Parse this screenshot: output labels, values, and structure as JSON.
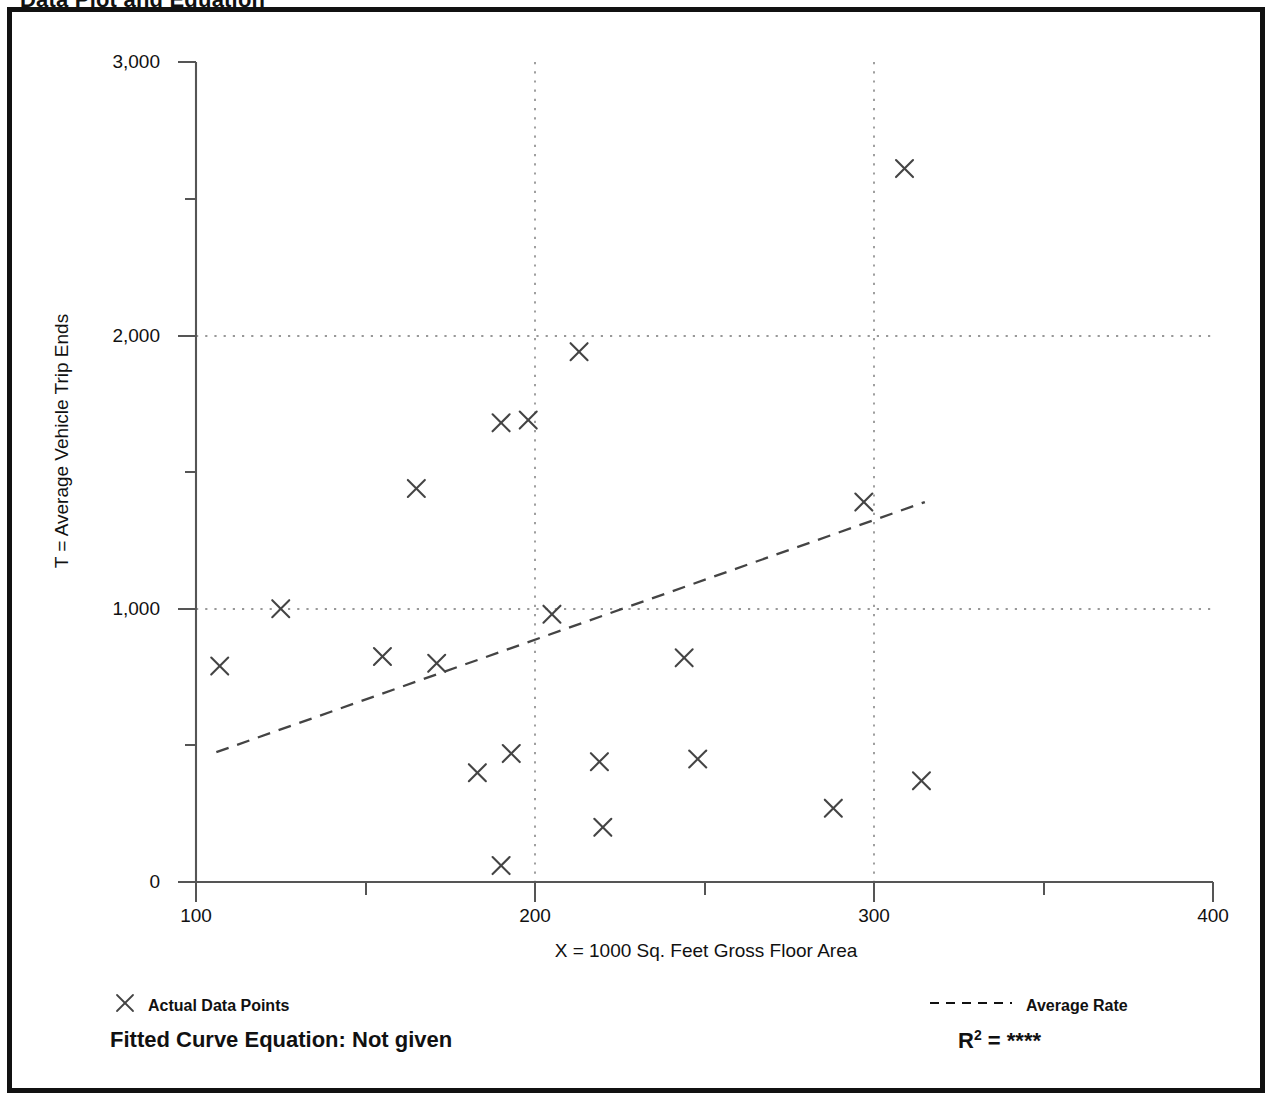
{
  "page": {
    "title": "Data Plot and Equation"
  },
  "chart_data": {
    "type": "scatter",
    "title": "Data Plot and Equation",
    "xlabel": "X = 1000 Sq. Feet Gross Floor Area",
    "ylabel": "T = Average Vehicle Trip Ends",
    "xlim": [
      100,
      400
    ],
    "ylim": [
      0,
      3000
    ],
    "xticks": [
      100,
      200,
      300,
      400
    ],
    "xticklabels": [
      "100",
      "200",
      "300",
      "400"
    ],
    "xminorticks": [
      150,
      250,
      350
    ],
    "yticks": [
      0,
      1000,
      2000,
      3000
    ],
    "yticklabels": [
      "0",
      "1,000",
      "2,000",
      "3,000"
    ],
    "yminorticks": [
      500,
      1500,
      2500
    ],
    "grid": "dotted gridlines at x=200, x=300 and y=1000, y=2000",
    "legend_position": "below plot",
    "series": [
      {
        "name": "Actual Data Points",
        "marker": "x",
        "points": [
          {
            "x": 107,
            "y": 790
          },
          {
            "x": 125,
            "y": 1000
          },
          {
            "x": 155,
            "y": 825
          },
          {
            "x": 165,
            "y": 1440
          },
          {
            "x": 171,
            "y": 800
          },
          {
            "x": 183,
            "y": 400
          },
          {
            "x": 190,
            "y": 1680
          },
          {
            "x": 190,
            "y": 60
          },
          {
            "x": 193,
            "y": 470
          },
          {
            "x": 198,
            "y": 1690
          },
          {
            "x": 205,
            "y": 980
          },
          {
            "x": 213,
            "y": 1940
          },
          {
            "x": 219,
            "y": 440
          },
          {
            "x": 220,
            "y": 200
          },
          {
            "x": 244,
            "y": 820
          },
          {
            "x": 248,
            "y": 450
          },
          {
            "x": 288,
            "y": 270
          },
          {
            "x": 297,
            "y": 1390
          },
          {
            "x": 309,
            "y": 2610
          },
          {
            "x": 314,
            "y": 370
          }
        ]
      },
      {
        "name": "Average Rate",
        "marker": "dashed-line",
        "line": [
          {
            "x": 106,
            "y": 475
          },
          {
            "x": 315,
            "y": 1390
          }
        ]
      }
    ],
    "annotations": {
      "equation": "Fitted Curve Equation:  Not given",
      "r_squared": "****"
    }
  },
  "axis": {
    "y_title": "T = Average Vehicle Trip Ends",
    "x_title": "X = 1000 Sq. Feet Gross Floor Area",
    "y_tick_labels": [
      "3,000",
      "2,000",
      "1,000",
      "0"
    ],
    "x_tick_labels": [
      "100",
      "200",
      "300",
      "400"
    ]
  },
  "legend": {
    "points_label": "Actual Data Points",
    "rate_label": "Average Rate",
    "point_marker": "x-marker",
    "rate_marker": "dashed-line"
  },
  "footer": {
    "equation_label": "Fitted Curve Equation:  Not given",
    "r2_prefix": "R",
    "r2_exponent": "2",
    "r2_equals": " = ",
    "r2_value": "****"
  },
  "colors": {
    "frame": "#111111",
    "axis": "#555555",
    "marker": "#444444",
    "gridline": "#777777",
    "text": "#111111"
  }
}
